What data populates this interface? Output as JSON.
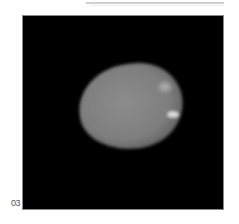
{
  "figure": {
    "panel_label": "03",
    "image_description": "Grayscale, irregularly shaped bright object on black background"
  }
}
